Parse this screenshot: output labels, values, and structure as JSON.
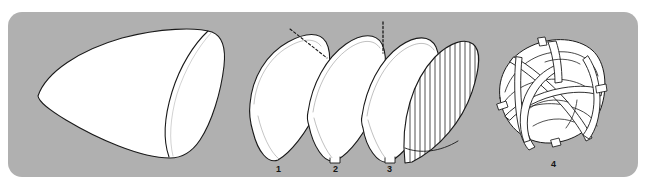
{
  "figure": {
    "type": "culinary-technique-illustration",
    "panel": {
      "background_color": "#b0b0b0",
      "corner_radius_px": 14,
      "x": 8,
      "y": 12,
      "width": 630,
      "height": 165
    },
    "page_background_color": "#ffffff",
    "line_color": "#1a1a1a",
    "shape_fill_color": "#ffffff"
  },
  "steps": [
    {
      "id": "step-0",
      "number": "",
      "name": "whole-cabbage-half",
      "description": "Large halved cabbage seen from the cut side, pointed at the left, with an interior curved core line toward the right"
    },
    {
      "id": "step-1",
      "number": "1",
      "name": "quarter-wedge",
      "description": "Cabbage quarter with a dashed guide line across the upper right corner indicating where to trim the core"
    },
    {
      "id": "step-2",
      "number": "2",
      "name": "trimmed-wedge",
      "description": "Wedge after the corner has been trimmed away"
    },
    {
      "id": "step-3",
      "number": "3",
      "name": "halved-wedge",
      "description": "Narrow wedge with a vertical dashed guide line above it showing the cutting direction"
    },
    {
      "id": "step-3b",
      "number": "",
      "name": "sliced-wedge",
      "description": "Wedge drawn with vertical hatch lines representing thin slices and a row of cross cuts along the bottom edge"
    },
    {
      "id": "step-4",
      "number": "4",
      "name": "shredded-pile",
      "description": "Loose tangled pile of shredded cabbage strips"
    }
  ],
  "labels": {
    "one": "1",
    "two": "2",
    "three": "3",
    "four": "4"
  },
  "annotations": {
    "dashed_guide_1": "diagonal dashed trim line on wedge 1",
    "dashed_guide_3": "vertical dashed cut line above wedge 3"
  }
}
